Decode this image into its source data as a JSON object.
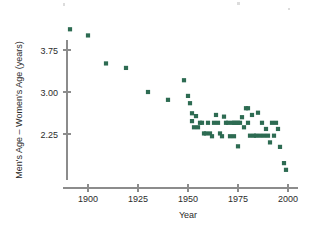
{
  "chart_data": {
    "type": "scatter",
    "title": "",
    "xlabel": "Year",
    "ylabel": "Men's Age – Women's Age (years)",
    "xlim": [
      1888,
      2003
    ],
    "ylim": [
      1.45,
      4.35
    ],
    "xticks": [
      1900,
      1925,
      1950,
      1975,
      2000
    ],
    "xticklabels": [
      "1900",
      "1925",
      "1950",
      "1975",
      "2000"
    ],
    "yticks": [
      2.25,
      3.0,
      3.75
    ],
    "yticklabels": [
      "2.25",
      "3.00",
      "3.75"
    ],
    "grid": false,
    "legend": null,
    "marker_color": "#2d6b52",
    "marker_size": 2.1,
    "axis_color": "#8c8c8c",
    "points": [
      [
        1891,
        4.12
      ],
      [
        1900,
        4.01
      ],
      [
        1909,
        3.51
      ],
      [
        1919,
        3.43
      ],
      [
        1930,
        3.0
      ],
      [
        1940,
        2.86
      ],
      [
        1948,
        3.21
      ],
      [
        1950,
        2.93
      ],
      [
        1951,
        2.8
      ],
      [
        1952,
        2.62
      ],
      [
        1952,
        2.48
      ],
      [
        1953,
        2.37
      ],
      [
        1954,
        2.57
      ],
      [
        1955,
        2.37
      ],
      [
        1956,
        2.45
      ],
      [
        1957,
        2.45
      ],
      [
        1958,
        2.26
      ],
      [
        1959,
        2.26
      ],
      [
        1960,
        2.45
      ],
      [
        1961,
        2.26
      ],
      [
        1962,
        2.21
      ],
      [
        1963,
        2.45
      ],
      [
        1964,
        2.59
      ],
      [
        1965,
        2.45
      ],
      [
        1966,
        2.26
      ],
      [
        1967,
        2.21
      ],
      [
        1968,
        2.56
      ],
      [
        1969,
        2.45
      ],
      [
        1970,
        2.45
      ],
      [
        1971,
        2.21
      ],
      [
        1972,
        2.45
      ],
      [
        1973,
        2.45
      ],
      [
        1973,
        2.21
      ],
      [
        1974,
        2.45
      ],
      [
        1975,
        2.45
      ],
      [
        1975,
        2.03
      ],
      [
        1976,
        2.45
      ],
      [
        1977,
        2.55
      ],
      [
        1978,
        2.37
      ],
      [
        1979,
        2.71
      ],
      [
        1980,
        2.71
      ],
      [
        1980,
        2.45
      ],
      [
        1981,
        2.22
      ],
      [
        1982,
        2.59
      ],
      [
        1983,
        2.22
      ],
      [
        1984,
        2.22
      ],
      [
        1985,
        2.63
      ],
      [
        1986,
        2.22
      ],
      [
        1987,
        2.45
      ],
      [
        1988,
        2.22
      ],
      [
        1989,
        2.34
      ],
      [
        1990,
        2.22
      ],
      [
        1991,
        2.1
      ],
      [
        1992,
        2.45
      ],
      [
        1993,
        2.22
      ],
      [
        1994,
        2.45
      ],
      [
        1995,
        2.34
      ],
      [
        1996,
        2.02
      ],
      [
        1998,
        1.73
      ],
      [
        1999,
        1.61
      ]
    ]
  }
}
